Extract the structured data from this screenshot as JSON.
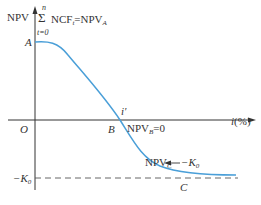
{
  "diagram": {
    "y_axis_label": "NPV",
    "x_axis_label": "i(%)",
    "origin_label": "O",
    "colors": {
      "curve": "#4a9fd8",
      "axes": "#333333",
      "dashed": "#555555",
      "arrow": "#333333"
    },
    "points": {
      "A": {
        "label": "A",
        "annotation_sum_upper": "n",
        "annotation_sum_lower": "t=0",
        "annotation_text": "NCF",
        "annotation_sub_t": "t",
        "annotation_eq": "=NPV",
        "annotation_sub": "A"
      },
      "B": {
        "label": "B",
        "irr_label": "i'",
        "annotation_text": "NPV",
        "annotation_sub": "B",
        "annotation_eq": "=0"
      },
      "C": {
        "label": "C",
        "annotation_text": "NPV",
        "annotation_sub": "C",
        "annotation_arrow": "→",
        "annotation_target": "−K",
        "annotation_target_sub": "0"
      }
    },
    "asymptote_label": "−K",
    "asymptote_sub": "0",
    "sigma_symbol": "Σ"
  }
}
